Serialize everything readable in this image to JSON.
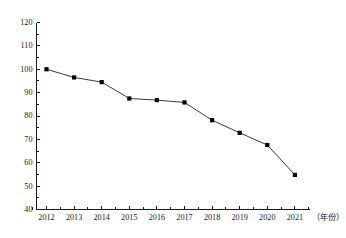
{
  "chart_data": {
    "type": "line",
    "title": "",
    "subtitle": "",
    "xlabel": "（年份）",
    "ylabel": "",
    "categories": [
      "2012",
      "2013",
      "2014",
      "2015",
      "2016",
      "2017",
      "2018",
      "2019",
      "2020",
      "2021"
    ],
    "x": [
      2012,
      2013,
      2014,
      2015,
      2016,
      2017,
      2018,
      2019,
      2020,
      2021
    ],
    "values": [
      100.0,
      96.5,
      94.5,
      87.5,
      86.8,
      85.8,
      78.2,
      72.8,
      67.6,
      54.8
    ],
    "series": [
      {
        "name": "",
        "values": [
          100.0,
          96.5,
          94.5,
          87.5,
          86.8,
          85.8,
          78.2,
          72.8,
          67.6,
          54.8
        ]
      }
    ],
    "ylim": [
      40,
      120
    ],
    "xlim": [
      2011.6,
      2021.6
    ],
    "ytick_step": 10,
    "ytick_minor_step": 5,
    "ytick_labels": [
      "40",
      "50",
      "60",
      "70",
      "80",
      "90",
      "100",
      "110",
      "120"
    ],
    "ytick_values": [
      40,
      50,
      60,
      70,
      80,
      90,
      100,
      110,
      120
    ],
    "grid": false,
    "legend": false,
    "legend_position": "none",
    "marker": "square",
    "line_color": "#3a3a3a",
    "marker_color": "#000000",
    "background_color": "#ffffff",
    "axis_color": "#1a1a1a",
    "annotations": []
  }
}
